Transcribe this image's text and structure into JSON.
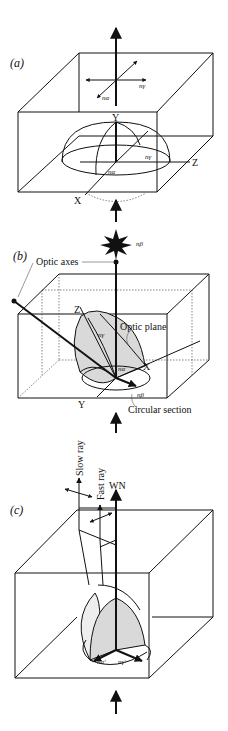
{
  "figure": {
    "panels": [
      {
        "id": "a",
        "label": "(a)",
        "axes": {
          "y": "Y",
          "z": "Z",
          "x": "X"
        },
        "indices": {
          "n_alpha_top": "nα",
          "n_gamma_top": "nγ",
          "n_gamma_body": "nγ",
          "n_alpha_body": "nα"
        }
      },
      {
        "id": "b",
        "label": "(b)",
        "axes": {
          "z": "Z",
          "x": "X",
          "y": "Y"
        },
        "indices": {
          "n_beta_top": "nβ",
          "n_gamma": "nγ",
          "n_alpha": "nα",
          "n_beta_bottom": "nβ"
        },
        "annotations": {
          "optic_axes": "Optic axes",
          "optic_plane": "Optic plane",
          "circular_section": "Circular section"
        }
      },
      {
        "id": "c",
        "label": "(c)",
        "rays": {
          "slow": "Slow ray",
          "fast": "Fast ray",
          "wave_normal": "WN"
        },
        "indices": {
          "n_alpha_prime": "nα′",
          "n_gamma_prime": "nγ′"
        }
      }
    ],
    "colors": {
      "line": "#111111",
      "fill_shade": "#d9d9d9",
      "fill_light": "#eeeeee",
      "background": "#ffffff"
    }
  }
}
